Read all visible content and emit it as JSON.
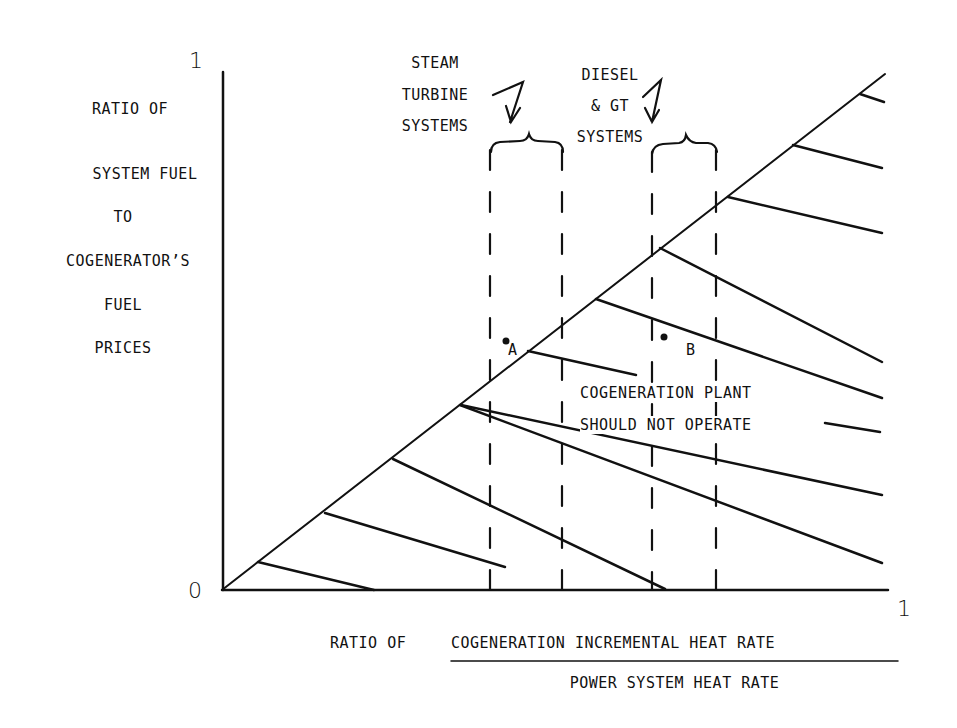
{
  "diagram": {
    "y_axis": {
      "label_lines": [
        "RATIO OF",
        "SYSTEM FUEL",
        "TO",
        "COGENERATOR’S",
        "FUEL",
        "PRICES"
      ],
      "max_label": "1",
      "min_label": "0"
    },
    "x_axis": {
      "label_prefix": "RATIO OF",
      "numerator": "COGENERATION INCREMENTAL HEAT RATE",
      "denominator": "POWER SYSTEM HEAT RATE",
      "max_label": "1"
    },
    "bands": [
      {
        "label_lines": [
          "STEAM",
          "TURBINE",
          "SYSTEMS"
        ]
      },
      {
        "label_lines": [
          "DIESEL",
          "& GT",
          "SYSTEMS"
        ]
      }
    ],
    "points": [
      {
        "label": "A"
      },
      {
        "label": "B"
      }
    ],
    "region_label_lines": [
      "COGENERATION PLANT",
      "SHOULD NOT OPERATE"
    ]
  }
}
